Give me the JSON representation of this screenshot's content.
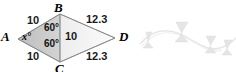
{
  "figure": {
    "type": "geometry-diagram",
    "shape": "kite-quadrilateral",
    "vertices": [
      {
        "name": "A",
        "label": "A",
        "position": "left"
      },
      {
        "name": "B",
        "label": "B",
        "position": "top"
      },
      {
        "name": "C",
        "label": "C",
        "position": "bottom"
      },
      {
        "name": "D",
        "label": "D",
        "position": "right"
      }
    ],
    "sides": [
      {
        "name": "AB",
        "label": "10"
      },
      {
        "name": "AC",
        "label": "10"
      },
      {
        "name": "BD",
        "label": "12.3"
      },
      {
        "name": "CD",
        "label": "12.3"
      }
    ],
    "diagonal": {
      "name": "BC",
      "label": "10"
    },
    "angles": [
      {
        "name": "ABC-upper",
        "label": "60°"
      },
      {
        "name": "ACB-lower",
        "label": "60°"
      },
      {
        "name": "BAC-unknown",
        "label": "x°"
      }
    ],
    "colors": {
      "left_fill": "#c9c9c9",
      "right_fill": "#f2f2f2",
      "outline": "#8a8a8a",
      "text": "#111111",
      "decoration": "#d8d8d8",
      "background": "#ffffff"
    }
  },
  "decoration": {
    "name": "wavy-ribbon-ornament",
    "description": "faint light-grey wavy line with small bowtie shapes"
  }
}
